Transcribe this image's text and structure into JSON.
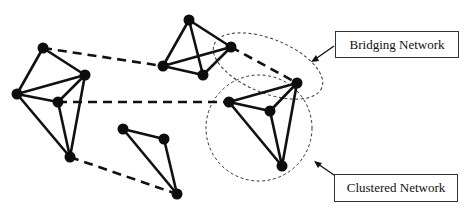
{
  "diagram": {
    "nodes": [
      {
        "id": "A",
        "x": 43,
        "y": 48
      },
      {
        "id": "B",
        "x": 85,
        "y": 75
      },
      {
        "id": "C",
        "x": 17,
        "y": 94
      },
      {
        "id": "D",
        "x": 58,
        "y": 102
      },
      {
        "id": "E",
        "x": 70,
        "y": 157
      },
      {
        "id": "F",
        "x": 189,
        "y": 20
      },
      {
        "id": "G",
        "x": 163,
        "y": 66
      },
      {
        "id": "H",
        "x": 203,
        "y": 75
      },
      {
        "id": "I",
        "x": 231,
        "y": 47
      },
      {
        "id": "J",
        "x": 123,
        "y": 129
      },
      {
        "id": "K",
        "x": 164,
        "y": 139
      },
      {
        "id": "L",
        "x": 177,
        "y": 194
      },
      {
        "id": "M",
        "x": 297,
        "y": 83
      },
      {
        "id": "N",
        "x": 229,
        "y": 102
      },
      {
        "id": "O",
        "x": 270,
        "y": 111
      },
      {
        "id": "P",
        "x": 282,
        "y": 166
      }
    ],
    "edges": [
      [
        "A",
        "B"
      ],
      [
        "A",
        "C"
      ],
      [
        "C",
        "B"
      ],
      [
        "C",
        "D"
      ],
      [
        "D",
        "B"
      ],
      [
        "C",
        "E"
      ],
      [
        "D",
        "E"
      ],
      [
        "B",
        "E"
      ],
      [
        "F",
        "G"
      ],
      [
        "F",
        "I"
      ],
      [
        "F",
        "H"
      ],
      [
        "G",
        "I"
      ],
      [
        "G",
        "H"
      ],
      [
        "H",
        "I"
      ],
      [
        "J",
        "K"
      ],
      [
        "J",
        "L"
      ],
      [
        "K",
        "L"
      ],
      [
        "N",
        "M"
      ],
      [
        "N",
        "O"
      ],
      [
        "O",
        "M"
      ],
      [
        "N",
        "P"
      ],
      [
        "O",
        "P"
      ],
      [
        "M",
        "P"
      ]
    ],
    "bridges": [
      [
        "A",
        "G"
      ],
      [
        "D",
        "N"
      ],
      [
        "E",
        "L"
      ],
      [
        "I",
        "M"
      ]
    ],
    "regions": {
      "bridging": {
        "cx": 268,
        "cy": 66,
        "rx": 58,
        "ry": 27,
        "rotate": 22
      },
      "clustered": {
        "cx": 259,
        "cy": 128,
        "r": 53
      }
    },
    "labels": {
      "bridging": "Bridging Network",
      "clustered": "Clustered Network"
    },
    "colors": {
      "ink": "#111111",
      "background": "#ffffff"
    }
  }
}
